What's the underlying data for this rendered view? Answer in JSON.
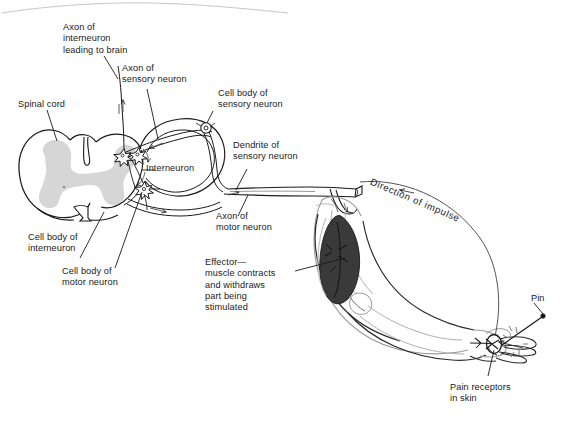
{
  "figure": {
    "background_color": "#ffffff",
    "ink_color": "#1a1a1a",
    "gray_matter_color": "#d6d6d6",
    "muscle_color": "#3a3a3a",
    "width": 571,
    "height": 423
  },
  "labels": {
    "axon_interneuron_brain": "Axon of\ninterneuron\nleading to brain",
    "axon_sensory_neuron": "Axon of\nsensory neuron",
    "cell_body_sensory_neuron": "Cell body of\nsensory neuron",
    "dendrite_sensory_neuron": "Dendrite of\nsensory neuron",
    "spinal_cord": "Spinal cord",
    "interneuron": "Interneuron",
    "cell_body_interneuron": "Cell body of\ninterneuron",
    "cell_body_motor_neuron": "Cell body of\nmotor neuron",
    "axon_motor_neuron": "Axon of\nmotor neuron",
    "effector": "Effector—\nmuscle contracts\nand withdraws\npart being\nstimulated",
    "direction_of_impulse": "Direction of impulse",
    "pin": "Pin",
    "pain_receptors": "Pain receptors\nin skin"
  },
  "structures": {
    "spinal_cord_name": "spinal-cord-cross-section",
    "gray_matter_name": "gray-matter-butterfly",
    "sensory_ganglion_name": "dorsal-root-ganglion",
    "interneuron_cell_name": "interneuron-cell-body",
    "motor_cell_name": "motor-neuron-cell-body",
    "nerve_bundle_name": "peripheral-nerve-bundle",
    "arm_name": "flexed-arm-outline",
    "biceps_name": "biceps-muscle",
    "hand_name": "hand-outline",
    "pin_name": "pin-object",
    "receptor_name": "pain-receptor-nerve-ending",
    "impulse_arc_name": "impulse-direction-arc"
  }
}
